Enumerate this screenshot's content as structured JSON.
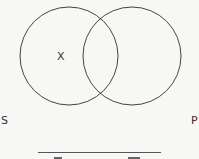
{
  "diagram": {
    "type": "venn",
    "circles": [
      {
        "name": "left-circle",
        "label": "S",
        "cx": 69,
        "cy": 56,
        "r": 49
      },
      {
        "name": "right-circle",
        "label": "P",
        "cx": 132,
        "cy": 56,
        "r": 49
      }
    ],
    "marks": [
      {
        "text": "X",
        "region": "S only"
      }
    ],
    "colors": {
      "stroke": "#444444",
      "text": "#333333",
      "background": "#f7f7f5"
    }
  }
}
